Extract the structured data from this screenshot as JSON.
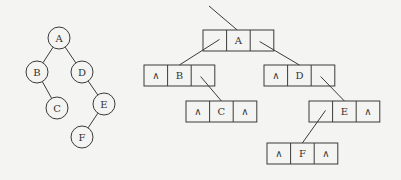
{
  "diagram": {
    "null_symbol": "∧",
    "colors": {
      "stroke": "#3a3a3a",
      "text": "#333333",
      "background": "#f4f4f2"
    },
    "tree": {
      "nodes": [
        {
          "id": "A",
          "label": "A"
        },
        {
          "id": "B",
          "label": "B"
        },
        {
          "id": "D",
          "label": "D"
        },
        {
          "id": "C",
          "label": "C"
        },
        {
          "id": "E",
          "label": "E"
        },
        {
          "id": "F",
          "label": "F"
        }
      ],
      "edges": [
        {
          "from": "A",
          "to": "B",
          "side": "left"
        },
        {
          "from": "A",
          "to": "D",
          "side": "right"
        },
        {
          "from": "B",
          "to": "C",
          "side": "right"
        },
        {
          "from": "D",
          "to": "E",
          "side": "right"
        },
        {
          "from": "E",
          "to": "F",
          "side": "left"
        }
      ]
    },
    "linked_list": {
      "root_pointer": true,
      "nodes": [
        {
          "id": "A",
          "lchild": "B",
          "data": "A",
          "rchild": "D"
        },
        {
          "id": "B",
          "lchild": null,
          "data": "B",
          "rchild": "C"
        },
        {
          "id": "D",
          "lchild": null,
          "data": "D",
          "rchild": "E"
        },
        {
          "id": "C",
          "lchild": null,
          "data": "C",
          "rchild": null
        },
        {
          "id": "E",
          "lchild": "F",
          "data": "E",
          "rchild": null
        },
        {
          "id": "F",
          "lchild": null,
          "data": "F",
          "rchild": null
        }
      ]
    }
  }
}
